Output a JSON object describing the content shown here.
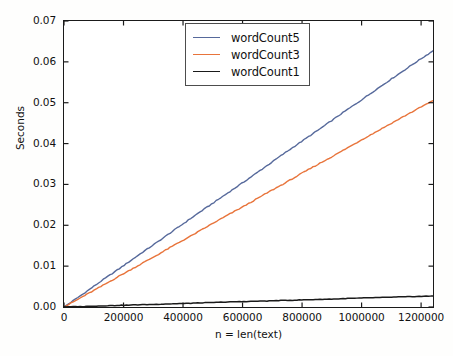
{
  "chart_data": {
    "type": "line",
    "title": "",
    "xlabel": "n = len(text)",
    "ylabel": "Seconds",
    "xlim": [
      0,
      1240000
    ],
    "ylim": [
      0.0,
      0.07
    ],
    "grid": false,
    "legend_position": "upper center",
    "xticks": [
      0,
      200000,
      400000,
      600000,
      800000,
      1000000,
      1200000
    ],
    "xtick_labels": [
      "0",
      "200000",
      "400000",
      "600000",
      "800000",
      "1000000",
      "1200000"
    ],
    "yticks": [
      0.0,
      0.01,
      0.02,
      0.03,
      0.04,
      0.05,
      0.06,
      0.07
    ],
    "ytick_labels": [
      "0.00",
      "0.01",
      "0.02",
      "0.03",
      "0.04",
      "0.05",
      "0.06",
      "0.07"
    ],
    "x": [
      0,
      62000,
      124000,
      186000,
      248000,
      310000,
      372000,
      434000,
      496000,
      558000,
      620000,
      682000,
      744000,
      806000,
      868000,
      930000,
      992000,
      1054000,
      1116000,
      1178000,
      1240000
    ],
    "series": [
      {
        "name": "wordCount5",
        "color": "#56699b",
        "values": [
          0.0,
          0.0031,
          0.0063,
          0.0094,
          0.0126,
          0.0157,
          0.0189,
          0.0221,
          0.0252,
          0.0283,
          0.0314,
          0.0346,
          0.0378,
          0.0409,
          0.044,
          0.0472,
          0.0503,
          0.0535,
          0.0566,
          0.0597,
          0.0627
        ]
      },
      {
        "name": "wordCount3",
        "color": "#e8743b",
        "values": [
          0.0,
          0.0025,
          0.005,
          0.0076,
          0.0101,
          0.0126,
          0.0152,
          0.0177,
          0.0203,
          0.0228,
          0.0253,
          0.0279,
          0.0304,
          0.033,
          0.0355,
          0.038,
          0.0406,
          0.0431,
          0.0456,
          0.0481,
          0.0505
        ]
      },
      {
        "name": "wordCount1",
        "color": "#1a1a1a",
        "values": [
          0.0,
          0.00013,
          0.00027,
          0.0004,
          0.00054,
          0.00067,
          0.00081,
          0.00094,
          0.00108,
          0.00125,
          0.00135,
          0.00148,
          0.00162,
          0.00175,
          0.00189,
          0.00202,
          0.00216,
          0.00229,
          0.00243,
          0.00256,
          0.0027
        ]
      }
    ]
  },
  "legend": {
    "items": [
      {
        "label": "wordCount5",
        "color": "#56699b"
      },
      {
        "label": "wordCount3",
        "color": "#e8743b"
      },
      {
        "label": "wordCount1",
        "color": "#1a1a1a"
      }
    ]
  },
  "axes": {
    "ylabel": "Seconds",
    "xlabel": "n = len(text)"
  }
}
